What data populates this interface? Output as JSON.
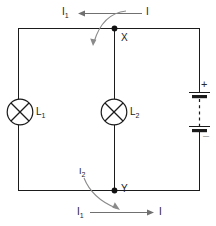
{
  "figure": {
    "type": "circuit-diagram",
    "width": 216,
    "height": 226,
    "background_color": "#ffffff",
    "wire_color": "#1b1b1b",
    "annotation_color": "#6e6e6e"
  },
  "labels": {
    "top_left_current": "I",
    "top_left_current_sub": "1",
    "top_right_current": "I",
    "branch_current": "I",
    "branch_current_sub": "2",
    "bottom_left_current": "I",
    "bottom_left_current_sub": "1",
    "bottom_right_current": "I",
    "node_x": "X",
    "node_y": "Y",
    "lamp_left": "L",
    "lamp_left_sub": "1",
    "lamp_right": "L",
    "lamp_right_sub": "2",
    "battery_positive": "+",
    "battery_negative": "–"
  },
  "components": {
    "lamp_left": {
      "name": "L1",
      "symbol": "lamp-crossed-circle",
      "position": {
        "cx": 20,
        "cy": 112,
        "r": 13
      }
    },
    "lamp_right": {
      "name": "L2",
      "symbol": "lamp-crossed-circle",
      "position": {
        "cx": 114,
        "cy": 112,
        "r": 13
      }
    },
    "battery": {
      "name": "Battery",
      "symbol": "multi-cell-battery",
      "cells": 2,
      "position": {
        "x": 199,
        "y_top": 92,
        "y_bottom": 131
      }
    }
  },
  "nodes": [
    {
      "name": "X",
      "x": 114,
      "y": 28
    },
    {
      "name": "Y",
      "x": 114,
      "y": 190
    }
  ],
  "currents": [
    {
      "name": "I",
      "location": "top-right-branch",
      "direction": "left"
    },
    {
      "name": "I1",
      "location": "top-left-branch",
      "direction": "left"
    },
    {
      "name": "I2",
      "location": "middle-branch",
      "direction": "down"
    },
    {
      "name": "I1",
      "location": "bottom-left-branch",
      "direction": "right"
    },
    {
      "name": "I",
      "location": "bottom-right-branch",
      "direction": "right"
    }
  ]
}
